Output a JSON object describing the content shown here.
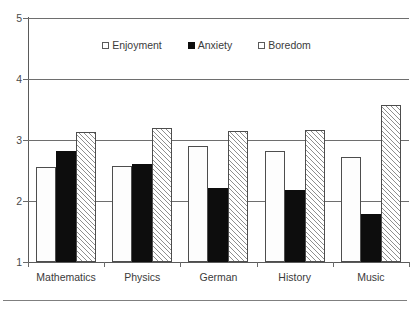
{
  "chart_data": {
    "type": "bar",
    "title": "",
    "subtitle": "",
    "xlabel": "",
    "ylabel": "",
    "ylim": [
      1,
      5
    ],
    "yticks": [
      "1",
      "2",
      "3",
      "4",
      "5"
    ],
    "grid": "horizontal",
    "legend_position": "top-center-inside",
    "baseline": 1,
    "categories": [
      "Mathematics",
      "Physics",
      "German",
      "History",
      "Music"
    ],
    "series": [
      {
        "name": "Enjoyment",
        "pattern": "dotted",
        "values": [
          2.55,
          2.58,
          2.9,
          2.82,
          2.72
        ]
      },
      {
        "name": "Anxiety",
        "pattern": "solid-black",
        "values": [
          2.82,
          2.6,
          2.22,
          2.18,
          1.79
        ]
      },
      {
        "name": "Boredom",
        "pattern": "diagonal-hatch",
        "values": [
          3.13,
          3.2,
          3.14,
          3.17,
          3.57
        ]
      }
    ]
  },
  "colors": {
    "axis": "#5a5a5a",
    "gridline": "#6e6e6e",
    "bar_outline": "#4d4d4d",
    "anxiety_fill": "#0d0d0d",
    "pattern_stroke": "#8e8e8e",
    "text": "#3b3b3b",
    "background": "#ffffff"
  }
}
